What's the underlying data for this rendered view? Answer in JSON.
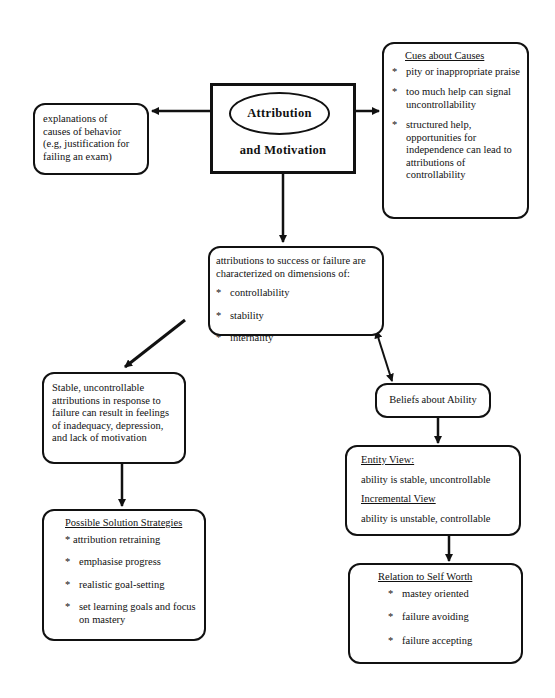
{
  "central": {
    "title_line1": "Attribution",
    "title_line2": "and  Motivation"
  },
  "explanations": {
    "lines": [
      "explanations of",
      "causes of behavior",
      "(e.g, justification for",
      "failing an exam)"
    ]
  },
  "cues": {
    "heading": "Cues about Causes",
    "bullet": "*",
    "items": [
      "pity or inappropriate praise",
      "too much help can signal uncontrollability",
      "structured help, opportunities for independence can lead to attributions of controllability"
    ]
  },
  "dimensions": {
    "intro": "attributions to success or failure are characterized on dimensions of:",
    "bullet": "*",
    "items": [
      "controllability",
      "stability",
      "internality"
    ]
  },
  "stable": {
    "text": "Stable, uncontrollable attributions in response to failure can result in feelings of inadequacy, depression, and lack of motivation"
  },
  "solutions": {
    "heading": "Possible Solution Strategies",
    "bullet": "*",
    "items": [
      "attribution retraining",
      "emphasise progress",
      "realistic goal-setting",
      "set learning goals and focus on mastery"
    ]
  },
  "beliefs": {
    "label": "Beliefs about Ability"
  },
  "views": {
    "entity_heading": "Entity View:",
    "entity_text": "ability is stable, uncontrollable",
    "incremental_heading": "Incremental View",
    "incremental_text": "ability is unstable, controllable"
  },
  "self_worth": {
    "heading": "Relation to Self Worth",
    "bullet": "*",
    "items": [
      "mastey oriented",
      "failure avoiding",
      "failure accepting"
    ]
  }
}
